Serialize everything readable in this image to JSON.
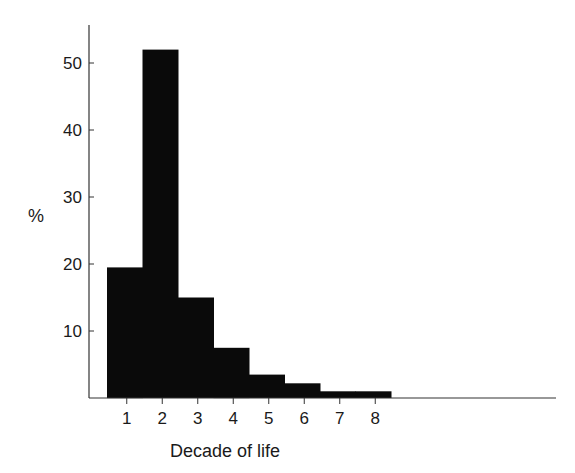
{
  "chart_data": {
    "type": "bar",
    "title": "",
    "xlabel": "Decade of life",
    "ylabel": "%",
    "categories": [
      "1",
      "2",
      "3",
      "4",
      "5",
      "6",
      "7",
      "8"
    ],
    "values": [
      19.5,
      52,
      15,
      7.5,
      3.5,
      2.2,
      1,
      1
    ],
    "yticks": [
      10,
      20,
      30,
      40,
      50
    ],
    "ylim": [
      0,
      56
    ],
    "grid": false,
    "legend": null,
    "bar_color": "#0a0a0a"
  }
}
